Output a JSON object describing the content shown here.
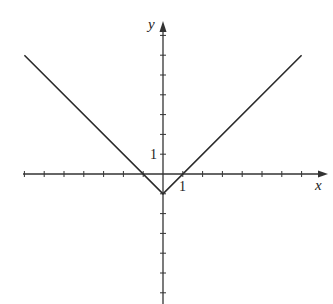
{
  "chart_data": {
    "type": "line",
    "title": "",
    "function": "y = |x| - 1",
    "xlabel": "x",
    "ylabel": "y",
    "xlim": [
      -7,
      8
    ],
    "ylim": [
      -6.5,
      7.5
    ],
    "grid": false,
    "tick_labels": {
      "x": [
        "1"
      ],
      "y": [
        "1"
      ]
    },
    "x_ticks": [
      -7,
      -6,
      -5,
      -4,
      -3,
      -2,
      -1,
      1,
      2,
      3,
      4,
      5,
      6,
      7
    ],
    "y_ticks": [
      -6,
      -5,
      -4,
      -3,
      -2,
      -1,
      1,
      2,
      3,
      4,
      5,
      6,
      7
    ],
    "series": [
      {
        "name": "y=|x|-1",
        "x": [
          -7,
          0,
          7
        ],
        "y": [
          6,
          -1,
          6
        ]
      }
    ],
    "colors": {
      "axis": "#333333",
      "line": "#2a2a2a"
    }
  },
  "labels": {
    "x_axis": "x",
    "y_axis": "y",
    "x_one": "1",
    "y_one": "1"
  }
}
